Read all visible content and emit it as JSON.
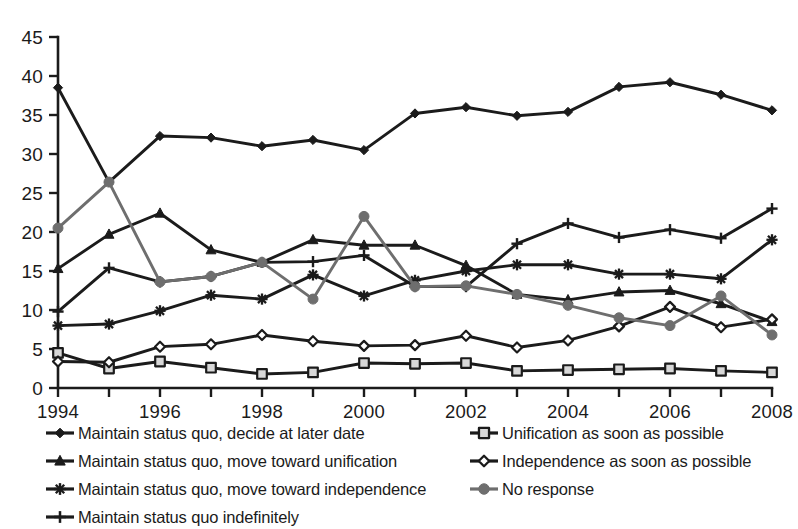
{
  "chart_data": {
    "type": "line",
    "title": "",
    "subtitle": "",
    "xlabel": "",
    "ylabel": "",
    "xlim": [
      1994,
      2008
    ],
    "ylim": [
      0,
      45
    ],
    "ytick_step": 5,
    "xtick_step": 2,
    "grid": false,
    "legend_position": "bottom",
    "x": [
      1994,
      1995,
      1996,
      1997,
      1998,
      1999,
      2000,
      2001,
      2002,
      2003,
      2004,
      2005,
      2006,
      2007,
      2008
    ],
    "ytick_labels": [
      "0",
      "5",
      "10",
      "15",
      "20",
      "25",
      "30",
      "35",
      "40",
      "45"
    ],
    "xtick_labels": [
      "1994",
      "1996",
      "1998",
      "2000",
      "2002",
      "2004",
      "2006",
      "2008"
    ],
    "series": [
      {
        "name": "Maintain status quo, decide at later date",
        "marker": "diamond-filled",
        "color": "#1b1b1b",
        "values": [
          38.5,
          26.4,
          32.3,
          32.1,
          31.0,
          31.8,
          30.5,
          35.2,
          36.0,
          34.9,
          35.4,
          38.6,
          39.2,
          37.6,
          35.6
        ]
      },
      {
        "name": "Maintain status quo, move toward unification",
        "marker": "triangle-filled",
        "color": "#1b1b1b",
        "values": [
          15.3,
          19.7,
          22.4,
          17.7,
          16.1,
          19.0,
          18.3,
          18.3,
          15.7,
          12.0,
          11.3,
          12.3,
          12.5,
          10.8,
          8.5
        ]
      },
      {
        "name": "Maintain status quo, move toward independence",
        "marker": "asterisk",
        "color": "#1b1b1b",
        "values": [
          8.0,
          8.2,
          9.9,
          11.9,
          11.4,
          14.5,
          11.8,
          13.8,
          15.0,
          15.8,
          15.8,
          14.6,
          14.6,
          14.0,
          19.0
        ]
      },
      {
        "name": "Maintain status quo indefinitely",
        "marker": "plus",
        "color": "#1b1b1b",
        "values": [
          9.8,
          15.4,
          13.6,
          14.3,
          16.1,
          16.2,
          17.0,
          13.0,
          13.0,
          18.5,
          21.1,
          19.3,
          20.3,
          19.2,
          23.0
        ]
      },
      {
        "name": "Unification as soon as possible",
        "marker": "square-open",
        "color": "#1b1b1b",
        "values": [
          4.5,
          2.5,
          3.4,
          2.6,
          1.8,
          2.0,
          3.2,
          3.1,
          3.2,
          2.2,
          2.3,
          2.4,
          2.5,
          2.2,
          2.0
        ]
      },
      {
        "name": "Independence as soon as possible",
        "marker": "diamond-open",
        "color": "#1b1b1b",
        "values": [
          3.4,
          3.3,
          5.3,
          5.6,
          6.8,
          6.0,
          5.4,
          5.5,
          6.7,
          5.2,
          6.1,
          7.9,
          10.4,
          7.8,
          8.8
        ]
      },
      {
        "name": "No response",
        "marker": "circle-filled",
        "color": "#6e6e6e",
        "values": [
          20.5,
          26.4,
          13.6,
          14.3,
          16.1,
          11.4,
          22.0,
          13.0,
          13.1,
          12.0,
          10.6,
          9.0,
          8.0,
          11.8,
          6.8
        ]
      }
    ]
  },
  "legend": {
    "left_column": [
      {
        "label": "Maintain status quo, decide at later date",
        "marker": "diamond-filled",
        "color": "#1b1b1b"
      },
      {
        "label": "Maintain status quo, move toward unification",
        "marker": "triangle-filled",
        "color": "#1b1b1b"
      },
      {
        "label": "Maintain status quo, move toward independence",
        "marker": "asterisk",
        "color": "#1b1b1b"
      },
      {
        "label": "Maintain status quo indefinitely",
        "marker": "plus",
        "color": "#1b1b1b"
      }
    ],
    "right_column": [
      {
        "label": "Unification as soon as possible",
        "marker": "square-open",
        "color": "#1b1b1b"
      },
      {
        "label": "Independence as soon as possible",
        "marker": "diamond-open",
        "color": "#1b1b1b"
      },
      {
        "label": "No response",
        "marker": "circle-filled",
        "color": "#6e6e6e"
      }
    ]
  },
  "colors": {
    "axis": "#1b1b1b",
    "text": "#1b1b1b",
    "series_black": "#1b1b1b",
    "series_gray": "#6e6e6e",
    "background": "#ffffff"
  }
}
